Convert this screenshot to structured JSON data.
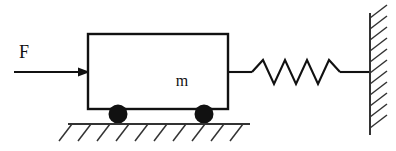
{
  "figure": {
    "width": 396,
    "height": 151,
    "background_color": "#ffffff",
    "line_color": "#111111",
    "hatch_color": "#333333"
  },
  "labels": {
    "force": "F",
    "mass": "m"
  },
  "force_arrow": {
    "name": "applied-force-arrow",
    "label": "F",
    "label_x": 24,
    "label_y": 58,
    "line_x1": 14,
    "line_x2": 84,
    "line_y": 72,
    "head_tip_x": 90,
    "head_back_x": 78,
    "head_half_height": 4.5,
    "direction": "right"
  },
  "mass_block": {
    "name": "mass-block",
    "label": "m",
    "x": 88,
    "y": 34,
    "width": 140,
    "height": 75,
    "label_x": 182,
    "label_y": 86,
    "fill": "#ffffff",
    "stroke": "#111111"
  },
  "wheels": [
    {
      "name": "wheel-left",
      "cx": 118,
      "cy": 114,
      "r": 9.5,
      "fill": "#111111"
    },
    {
      "name": "wheel-right",
      "cx": 204,
      "cy": 114,
      "r": 9.5,
      "fill": "#111111"
    }
  ],
  "ground": {
    "name": "ground-surface",
    "line_x1": 68,
    "line_x2": 250,
    "line_y": 124,
    "hatch_count": 10,
    "hatch_start_x": 72,
    "hatch_spacing": 19,
    "hatch_dx": -13,
    "hatch_dy": 17
  },
  "spring": {
    "name": "spring-element",
    "lead_left_x1": 228,
    "lead_left_x2": 252,
    "lead_right_x1": 340,
    "lead_right_x2": 370,
    "center_y": 72,
    "amplitude": 12,
    "coil_count": 4,
    "zigzag_start_x": 252,
    "zigzag_end_x": 340
  },
  "wall": {
    "name": "fixed-wall",
    "line_x": 370,
    "line_y1": 13,
    "line_y2": 135,
    "hatch_count": 11,
    "hatch_start_y": 18,
    "hatch_spacing": 11,
    "hatch_dx": 17,
    "hatch_dy": -13
  }
}
